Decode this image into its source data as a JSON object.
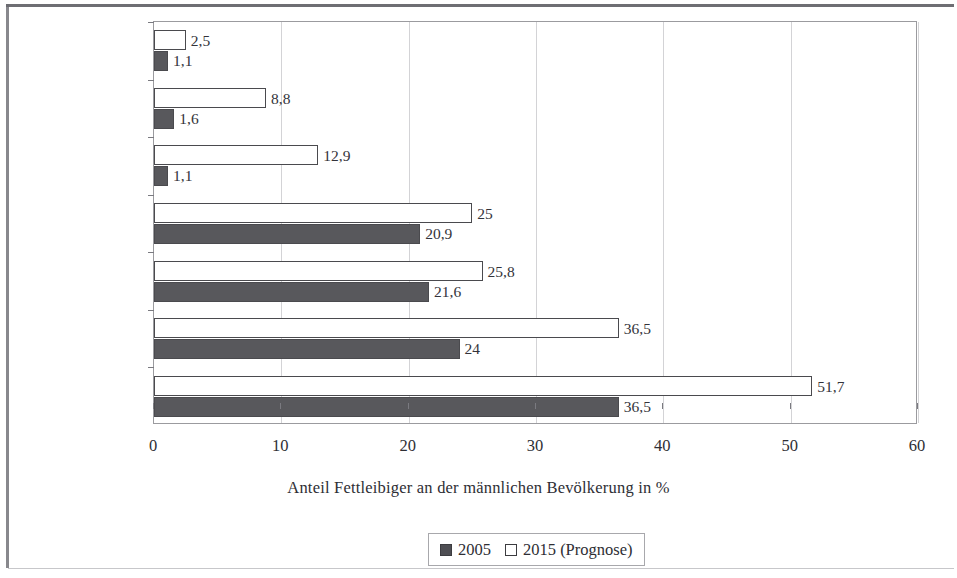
{
  "chart_data": {
    "type": "bar",
    "orientation": "horizontal",
    "title": "",
    "xlabel": "Anteil Fettleibiger an der männlichen Bevölkerung in %",
    "ylabel": "",
    "xlim": [
      0,
      60
    ],
    "xticks": [
      "0",
      "10",
      "20",
      "30",
      "40",
      "50",
      "60"
    ],
    "grid": "vertical",
    "legend_position": "bottom",
    "categories": [
      "Indien",
      "China",
      "Philippinen",
      "Deutschland",
      "Großbritannien",
      "Mexiko",
      "USA"
    ],
    "series": [
      {
        "name": "2005",
        "style": "filled",
        "color": "#58585c",
        "values": [
          1.1,
          1.6,
          1.1,
          20.9,
          21.6,
          24,
          36.5
        ],
        "labels": [
          "1,1",
          "1,6",
          "1,1",
          "20,9",
          "21,6",
          "24",
          "36,5"
        ]
      },
      {
        "name": "2015 (Prognose)",
        "style": "open",
        "color": "#ffffff",
        "values": [
          2.5,
          8.8,
          12.9,
          25,
          25.8,
          36.5,
          51.7
        ],
        "labels": [
          "2,5",
          "8,8",
          "12,9",
          "25",
          "25,8",
          "36,5",
          "51,7"
        ]
      }
    ]
  },
  "legend": {
    "entries": [
      {
        "label": "2005",
        "style": "filled"
      },
      {
        "label": "2015 (Prognose)",
        "style": "open"
      }
    ]
  }
}
